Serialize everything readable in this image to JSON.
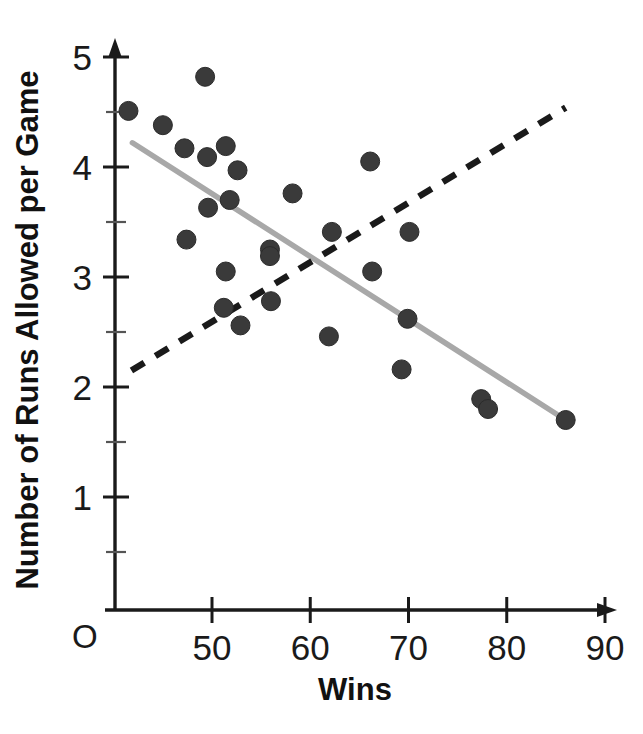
{
  "chart_data": {
    "type": "scatter",
    "title": "",
    "xlabel": "Wins",
    "ylabel": "Number of Runs Allowed per Game",
    "xlim": [
      40,
      90
    ],
    "ylim": [
      0,
      5
    ],
    "x_ticks": [
      50,
      60,
      70,
      80,
      90
    ],
    "y_ticks": [
      1,
      2,
      3,
      4,
      5
    ],
    "x_minor_step": 5,
    "y_minor_step": 0.5,
    "grid": false,
    "legend": "none",
    "origin_label": "O",
    "points": [
      {
        "x": 41.5,
        "y": 4.51
      },
      {
        "x": 49.3,
        "y": 4.82
      },
      {
        "x": 45.0,
        "y": 4.38
      },
      {
        "x": 47.2,
        "y": 4.17
      },
      {
        "x": 49.5,
        "y": 4.09
      },
      {
        "x": 51.4,
        "y": 4.19
      },
      {
        "x": 52.6,
        "y": 3.97
      },
      {
        "x": 49.6,
        "y": 3.63
      },
      {
        "x": 51.8,
        "y": 3.7
      },
      {
        "x": 47.4,
        "y": 3.34
      },
      {
        "x": 51.4,
        "y": 3.05
      },
      {
        "x": 51.2,
        "y": 2.72
      },
      {
        "x": 52.9,
        "y": 2.56
      },
      {
        "x": 55.9,
        "y": 3.25
      },
      {
        "x": 55.9,
        "y": 3.19
      },
      {
        "x": 56.0,
        "y": 2.78
      },
      {
        "x": 58.2,
        "y": 3.76
      },
      {
        "x": 62.2,
        "y": 3.41
      },
      {
        "x": 61.9,
        "y": 2.46
      },
      {
        "x": 66.1,
        "y": 4.05
      },
      {
        "x": 66.3,
        "y": 3.05
      },
      {
        "x": 70.1,
        "y": 3.41
      },
      {
        "x": 69.9,
        "y": 2.62
      },
      {
        "x": 69.3,
        "y": 2.16
      },
      {
        "x": 77.4,
        "y": 1.89
      },
      {
        "x": 78.1,
        "y": 1.8
      },
      {
        "x": 86.0,
        "y": 1.7
      }
    ],
    "series": [
      {
        "name": "solid-trend-line",
        "type": "line",
        "style": "solid",
        "color": "#a8a8a8",
        "x": [
          41.9,
          86.0
        ],
        "y": [
          4.22,
          1.7
        ]
      },
      {
        "name": "dashed-trend-line",
        "type": "line",
        "style": "dashed",
        "color": "#1a1a1a",
        "x": [
          41.8,
          86.0
        ],
        "y": [
          2.15,
          4.54
        ]
      }
    ]
  },
  "axes": {
    "x_title": "Wins",
    "y_title": "Number of Runs Allowed per Game",
    "origin": "O",
    "x_tick_labels": [
      "50",
      "60",
      "70",
      "80",
      "90"
    ],
    "y_tick_labels": [
      "1",
      "2",
      "3",
      "4",
      "5"
    ]
  },
  "colors": {
    "point_fill": "#3a3a3a",
    "solid_line": "#a8a8a8",
    "dashed_line": "#1a1a1a",
    "axis": "#1a1a1a",
    "background": "#ffffff"
  }
}
